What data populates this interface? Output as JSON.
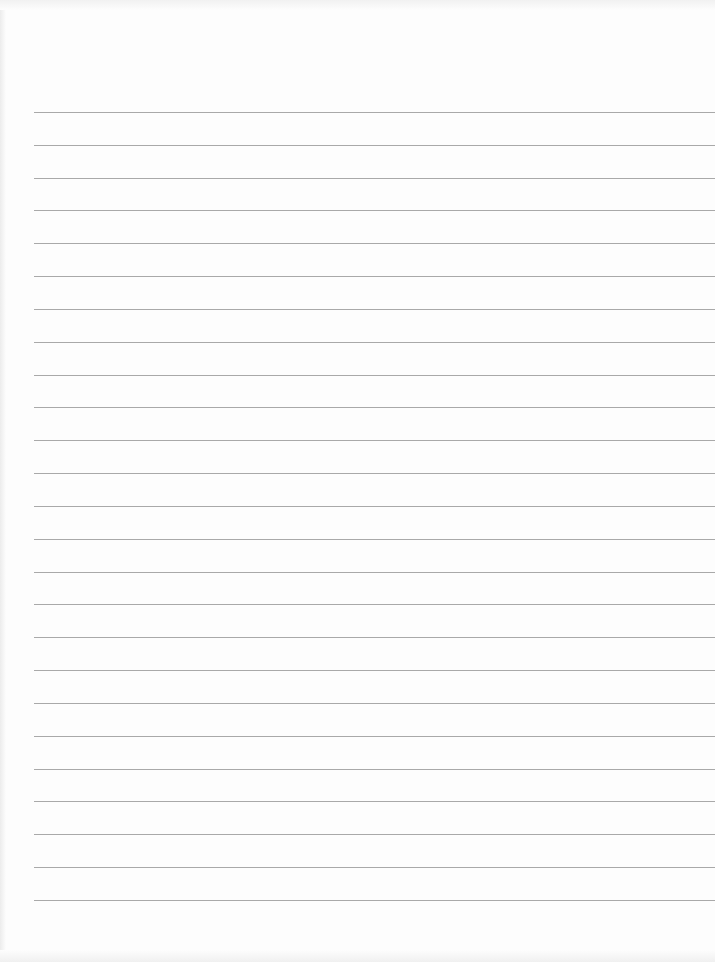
{
  "page": {
    "type": "lined-paper",
    "background": "#fdfdfd",
    "line_color": "#a9a9a9",
    "line_count": 25,
    "first_line_y": 112,
    "line_spacing": 32.83,
    "line_left": 34
  }
}
